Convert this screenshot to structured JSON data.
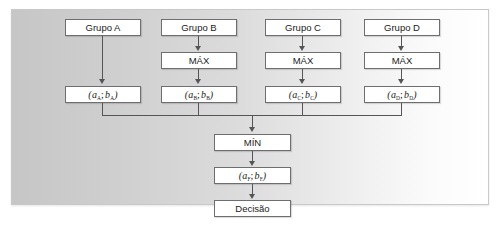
{
  "diagram": {
    "title_present": false,
    "panel": {
      "background_gradient_from": "#c6c6c6",
      "background_gradient_to": "#ffffff",
      "border_color": "#c9c9c9"
    },
    "node_style": {
      "fill": "#ffffff",
      "border_color": "#6e6e6e",
      "text_color": "#1a1a1a"
    },
    "connector_color": "#555555",
    "groups": [
      {
        "id": "A",
        "group_label": "Grupo A",
        "operator_label": null,
        "pair_a": "a",
        "pair_b": "b",
        "subscript": "A"
      },
      {
        "id": "B",
        "group_label": "Grupo B",
        "operator_label": "MÁX",
        "pair_a": "a",
        "pair_b": "b",
        "subscript": "B"
      },
      {
        "id": "C",
        "group_label": "Grupo C",
        "operator_label": "MÁX",
        "pair_a": "a",
        "pair_b": "b",
        "subscript": "C"
      },
      {
        "id": "D",
        "group_label": "Grupo D",
        "operator_label": "MÁX",
        "pair_a": "a",
        "pair_b": "b",
        "subscript": "D"
      }
    ],
    "aggregate": {
      "operator_label": "MÍN",
      "result_pair_a": "a",
      "result_pair_b": "b",
      "result_subscript": "F",
      "decision_label": "Decisão"
    },
    "separator": ";"
  }
}
